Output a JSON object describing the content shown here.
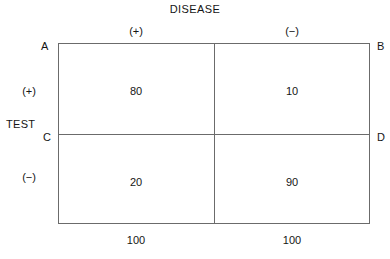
{
  "chart_data": {
    "type": "table",
    "title": "DISEASE",
    "xlabel": "DISEASE",
    "ylabel": "TEST",
    "col_headers": [
      "(+)",
      "(−)"
    ],
    "row_headers": [
      "(+)",
      "(−)"
    ],
    "values": [
      [
        80,
        10
      ],
      [
        20,
        90
      ]
    ],
    "col_totals": [
      100,
      100
    ],
    "vertex_labels": [
      "A",
      "B",
      "C",
      "D"
    ],
    "grid": true,
    "legend": "none"
  },
  "diagram": {
    "title": "DISEASE",
    "row_axis_label": "TEST",
    "columns": [
      {
        "header": "(+)",
        "total": "100"
      },
      {
        "header": "−)",
        "total": "100"
      }
    ],
    "column_header_positive": "(+)",
    "column_header_negative": "(−)",
    "row_header_positive": "(+)",
    "row_header_negative": "(−)",
    "vertex_top_left": "A",
    "vertex_top_right": "B",
    "vertex_mid_left": "C",
    "vertex_mid_right": "D",
    "cells": {
      "true_positive": "80",
      "false_positive": "10",
      "false_negative": "20",
      "true_negative": "90"
    },
    "totals": {
      "column_positive": "100",
      "column_negative": "100"
    }
  }
}
